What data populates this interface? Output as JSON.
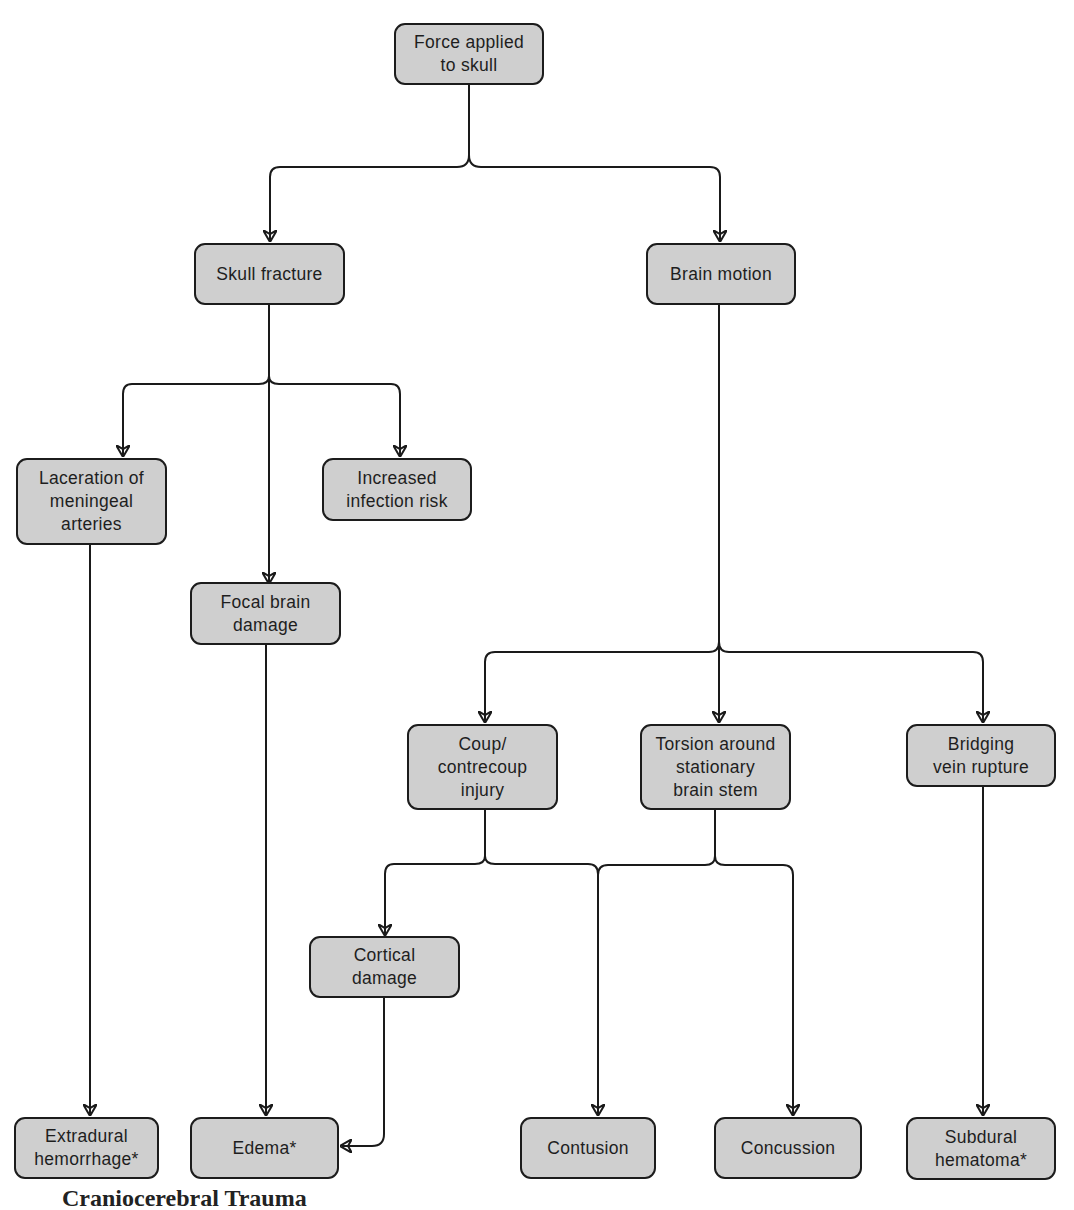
{
  "diagram": {
    "type": "flowchart",
    "colors": {
      "node_fill": "#cfcfcf",
      "node_border": "#1c1c1c",
      "line": "#1a1a1a",
      "background": "#ffffff"
    },
    "nodes": {
      "force": {
        "label": "Force applied\nto skull"
      },
      "skull_fracture": {
        "label": "Skull fracture"
      },
      "brain_motion": {
        "label": "Brain motion"
      },
      "laceration": {
        "label": "Laceration of\nmeningeal\narteries"
      },
      "infection": {
        "label": "Increased\ninfection risk"
      },
      "focal": {
        "label": "Focal brain\ndamage"
      },
      "coup": {
        "label": "Coup/\ncontrecoup\ninjury"
      },
      "torsion": {
        "label": "Torsion around\nstationary\nbrain stem"
      },
      "bridging": {
        "label": "Bridging\nvein rupture"
      },
      "cortical": {
        "label": "Cortical\ndamage"
      },
      "extradural": {
        "label": "Extradural\nhemorrhage*"
      },
      "edema": {
        "label": "Edema*"
      },
      "contusion": {
        "label": "Contusion"
      },
      "concussion": {
        "label": "Concussion"
      },
      "subdural": {
        "label": "Subdural\nhematoma*"
      }
    },
    "edges": [
      [
        "force",
        "skull_fracture"
      ],
      [
        "force",
        "brain_motion"
      ],
      [
        "skull_fracture",
        "laceration"
      ],
      [
        "skull_fracture",
        "focal"
      ],
      [
        "skull_fracture",
        "infection"
      ],
      [
        "brain_motion",
        "coup"
      ],
      [
        "brain_motion",
        "torsion"
      ],
      [
        "brain_motion",
        "bridging"
      ],
      [
        "laceration",
        "extradural"
      ],
      [
        "focal",
        "edema"
      ],
      [
        "coup",
        "cortical"
      ],
      [
        "coup",
        "contusion"
      ],
      [
        "torsion",
        "contusion"
      ],
      [
        "torsion",
        "concussion"
      ],
      [
        "cortical",
        "edema"
      ],
      [
        "bridging",
        "subdural"
      ]
    ]
  },
  "caption": {
    "text": "Craniocerebral Trauma"
  }
}
